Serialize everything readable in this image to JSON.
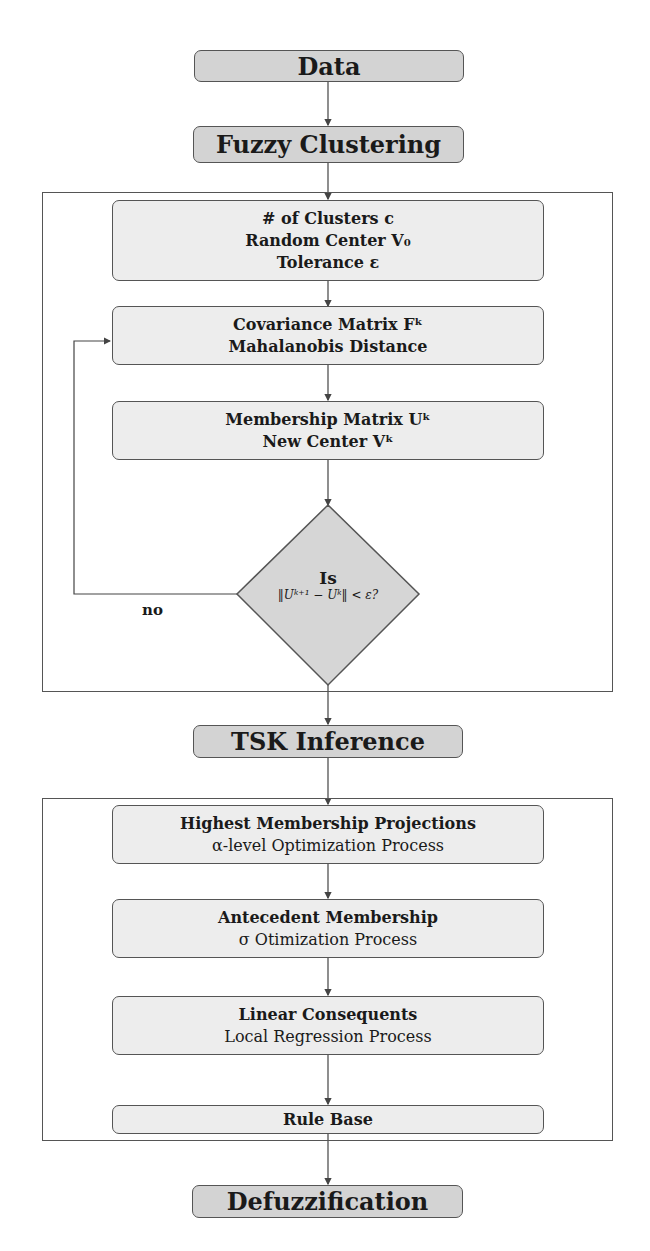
{
  "diagram": {
    "nodes": {
      "data": {
        "label": "Data"
      },
      "fuzzy_clustering": {
        "label": "Fuzzy Clustering"
      },
      "init": {
        "line1": "# of Clusters c",
        "line2": "Random Center V₀",
        "line3": "Tolerance ε"
      },
      "covariance": {
        "line1": "Covariance Matrix Fᵏ",
        "line2": "Mahalanobis Distance"
      },
      "membership": {
        "line1": "Membership Matrix Uᵏ",
        "line2": "New Center Vᵏ"
      },
      "decision": {
        "line1": "Is",
        "line2": "‖Uᵏ⁺¹ − Uᵏ‖ < ε?"
      },
      "tsk": {
        "label": "TSK Inference"
      },
      "highest": {
        "line1": "Highest Membership Projections",
        "line2": "α-level Optimization Process"
      },
      "antecedent": {
        "line1": "Antecedent Membership",
        "line2": "σ Otimization Process"
      },
      "linear": {
        "line1": "Linear Consequents",
        "line2": "Local Regression Process"
      },
      "rule_base": {
        "label": "Rule Base"
      },
      "defuzz": {
        "label": "Defuzzification"
      }
    },
    "edge_labels": {
      "no": "no"
    },
    "colors": {
      "top_fill": "#d3d3d3",
      "inner_fill": "#ededed",
      "stroke": "#555555"
    }
  }
}
